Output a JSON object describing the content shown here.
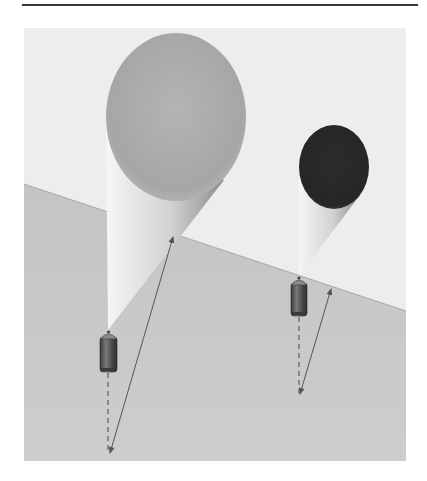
{
  "page": {
    "header_rule": true
  },
  "figure": {
    "frame": {
      "x": 24,
      "y": 28,
      "width": 382,
      "height": 433
    },
    "colors": {
      "sky": "#ededed",
      "ground": "#c9c9c9",
      "large_balloon": "#a9a9a9",
      "small_balloon": "#2b2b2b",
      "beam_light": "#f4f4f4",
      "beam_dark": "#9a9a9a",
      "canister": "#5a5a5a",
      "arrow": "#555555"
    },
    "horizon": {
      "x1": 24,
      "y1": 184,
      "x2": 406,
      "y2": 311
    },
    "objects": [
      {
        "name": "large-balloon",
        "ellipse": {
          "cx": 176,
          "cy": 117,
          "rx": 70,
          "ry": 84
        },
        "cone_apex": {
          "x": 108,
          "y": 330
        },
        "cone_right": {
          "x": 224,
          "y": 180
        },
        "canister": {
          "x": 100,
          "y": 332,
          "w": 17,
          "h": 40
        },
        "dashed_line": {
          "x": 108,
          "y1": 373,
          "y2": 452
        },
        "arrow": {
          "x1": 110,
          "y1": 453,
          "x2": 173,
          "y2": 237
        }
      },
      {
        "name": "small-balloon",
        "ellipse": {
          "cx": 334,
          "cy": 167,
          "rx": 35,
          "ry": 42
        },
        "cone_apex": {
          "x": 299,
          "y": 276
        },
        "cone_right": {
          "x": 360,
          "y": 195
        },
        "canister": {
          "x": 291,
          "y": 278,
          "w": 16,
          "h": 38
        },
        "dashed_line": {
          "x": 299,
          "y1": 317,
          "y2": 393
        },
        "arrow": {
          "x1": 300,
          "y1": 394,
          "x2": 331,
          "y2": 289
        }
      }
    ]
  }
}
